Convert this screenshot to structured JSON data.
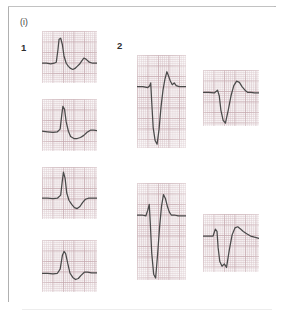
{
  "figure": {
    "part_label": "(i)",
    "groups": [
      {
        "id": "1",
        "label": "1"
      },
      {
        "id": "2",
        "label": "2"
      }
    ],
    "trace_color": "#4a4a4a",
    "grid_color": "#d6c1c6",
    "grid_bold_color": "#c6aab0",
    "strip_background": "#f7f3f4",
    "frame_border_color": "#b9b9b9"
  },
  "chart_data": [
    {
      "type": "line",
      "name": "group-1-strip-1",
      "title": "",
      "xlabel": "",
      "ylabel": "",
      "group": "1",
      "morphology": "positive tall R wave with small S and biphasic T",
      "xlim": [
        0,
        100
      ],
      "ylim": [
        0,
        100
      ],
      "grid": true,
      "legend": "none",
      "x": [
        0,
        8,
        16,
        22,
        26,
        29,
        31,
        34,
        37,
        40,
        44,
        48,
        52,
        56,
        60,
        64,
        68,
        72,
        76,
        80,
        86,
        92,
        100
      ],
      "y": [
        62,
        62,
        63,
        62,
        60,
        36,
        16,
        14,
        26,
        48,
        62,
        68,
        72,
        74,
        72,
        68,
        64,
        58,
        52,
        54,
        60,
        62,
        62
      ]
    },
    {
      "type": "line",
      "name": "group-1-strip-2",
      "title": "",
      "xlabel": "",
      "ylabel": "",
      "group": "1",
      "morphology": "tall narrow R wave, flat depressed ST, low T",
      "xlim": [
        0,
        100
      ],
      "ylim": [
        0,
        100
      ],
      "grid": true,
      "legend": "none",
      "x": [
        0,
        10,
        20,
        28,
        33,
        36,
        38,
        41,
        44,
        48,
        52,
        58,
        64,
        70,
        76,
        82,
        88,
        94,
        100
      ],
      "y": [
        62,
        63,
        64,
        63,
        58,
        30,
        14,
        20,
        44,
        62,
        72,
        76,
        76,
        74,
        70,
        64,
        60,
        60,
        61
      ]
    },
    {
      "type": "line",
      "name": "group-1-strip-3",
      "title": "",
      "xlabel": "",
      "ylabel": "",
      "group": "1",
      "morphology": "sharp tall R wave with deep negative T wave",
      "xlim": [
        0,
        100
      ],
      "ylim": [
        0,
        100
      ],
      "grid": true,
      "legend": "none",
      "x": [
        0,
        10,
        20,
        28,
        34,
        37,
        39,
        42,
        45,
        49,
        54,
        59,
        64,
        69,
        74,
        79,
        85,
        92,
        100
      ],
      "y": [
        60,
        60,
        61,
        60,
        54,
        26,
        10,
        22,
        50,
        64,
        72,
        78,
        80,
        76,
        68,
        62,
        60,
        60,
        60
      ]
    },
    {
      "type": "line",
      "name": "group-1-strip-4",
      "title": "",
      "xlabel": "",
      "ylabel": "",
      "group": "1",
      "morphology": "rounded tall R wave with shallow negative T",
      "xlim": [
        0,
        100
      ],
      "ylim": [
        0,
        100
      ],
      "grid": true,
      "legend": "none",
      "x": [
        0,
        10,
        20,
        28,
        33,
        37,
        40,
        43,
        47,
        51,
        56,
        61,
        66,
        71,
        77,
        83,
        90,
        100
      ],
      "y": [
        64,
        64,
        65,
        64,
        56,
        30,
        22,
        26,
        46,
        64,
        72,
        76,
        74,
        68,
        62,
        62,
        63,
        63
      ]
    },
    {
      "type": "line",
      "name": "group-2-strip-1",
      "title": "",
      "xlabel": "",
      "ylabel": "",
      "group": "2",
      "morphology": "deep wide QS complex with tall positive T wave",
      "xlim": [
        0,
        100
      ],
      "ylim": [
        0,
        100
      ],
      "grid": true,
      "legend": "none",
      "x": [
        0,
        12,
        22,
        26,
        28,
        30,
        33,
        37,
        41,
        45,
        49,
        53,
        57,
        61,
        64,
        68,
        72,
        76,
        80,
        86,
        92,
        100
      ],
      "y": [
        34,
        34,
        35,
        33,
        30,
        50,
        78,
        92,
        96,
        80,
        56,
        38,
        26,
        18,
        22,
        28,
        32,
        30,
        33,
        34,
        34,
        34
      ]
    },
    {
      "type": "line",
      "name": "group-2-strip-2",
      "title": "",
      "xlabel": "",
      "ylabel": "",
      "group": "2",
      "morphology": "deep narrow S wave with broad domed positive T wave",
      "xlim": [
        0,
        100
      ],
      "ylim": [
        0,
        100
      ],
      "grid": true,
      "legend": "none",
      "x": [
        0,
        10,
        20,
        26,
        29,
        32,
        36,
        40,
        45,
        50,
        55,
        60,
        65,
        70,
        75,
        80,
        86,
        92,
        100
      ],
      "y": [
        40,
        40,
        41,
        36,
        46,
        72,
        90,
        95,
        72,
        46,
        28,
        20,
        22,
        30,
        36,
        40,
        40,
        41,
        41
      ]
    },
    {
      "type": "line",
      "name": "group-2-strip-3",
      "title": "",
      "xlabel": "",
      "ylabel": "",
      "group": "2",
      "morphology": "very deep narrow QS complex with tall peaked T wave",
      "xlim": [
        0,
        100
      ],
      "ylim": [
        0,
        100
      ],
      "grid": true,
      "legend": "none",
      "x": [
        0,
        10,
        18,
        22,
        25,
        27,
        30,
        34,
        38,
        42,
        46,
        50,
        54,
        58,
        62,
        66,
        70,
        76,
        84,
        92,
        100
      ],
      "y": [
        33,
        33,
        34,
        28,
        22,
        40,
        72,
        94,
        98,
        74,
        46,
        24,
        12,
        16,
        24,
        30,
        33,
        33,
        34,
        34,
        34
      ]
    },
    {
      "type": "line",
      "name": "group-2-strip-4",
      "title": "",
      "xlabel": "",
      "ylabel": "",
      "group": "2",
      "morphology": "deep notched S wave with broad plateau T wave",
      "xlim": [
        0,
        100
      ],
      "ylim": [
        0,
        100
      ],
      "grid": true,
      "legend": "none",
      "x": [
        0,
        10,
        18,
        22,
        25,
        27,
        30,
        34,
        38,
        42,
        47,
        52,
        57,
        62,
        67,
        72,
        78,
        85,
        92,
        100
      ],
      "y": [
        38,
        38,
        38,
        26,
        30,
        58,
        82,
        90,
        86,
        92,
        62,
        36,
        24,
        22,
        26,
        30,
        34,
        38,
        40,
        42
      ]
    }
  ]
}
